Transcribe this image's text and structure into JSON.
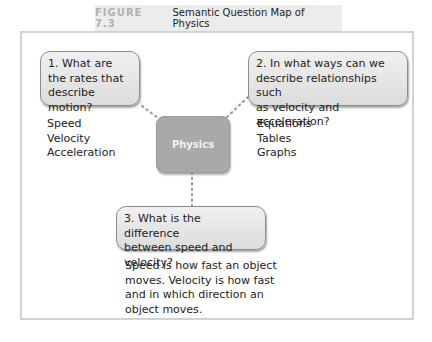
{
  "figure": {
    "label": "FIGURE 7.3",
    "title": "Semantic Question Map of Physics"
  },
  "center": {
    "label": "Physics"
  },
  "questions": [
    {
      "text": "1. What are the rates that describe motion?",
      "lines": [
        "1. What are",
        "the rates that",
        "describe motion?"
      ],
      "answers": [
        "Speed",
        "Velocity",
        "Acceleration"
      ]
    },
    {
      "text": "2. In what ways can we describe relationships such as velocity and acceleration?",
      "lines": [
        "2. In what ways can we",
        "describe relationships such",
        "as velocity and acceleration?"
      ],
      "answers": [
        "Equations",
        "Tables",
        "Graphs"
      ]
    },
    {
      "text": "3. What is the difference between speed and velocity?",
      "lines": [
        "3. What is the difference",
        "between speed and velocity?"
      ],
      "answers": [
        "Speed is how fast an object",
        "moves. Velocity is how fast",
        "and in which direction an",
        "object moves."
      ]
    }
  ],
  "colors": {
    "box_border": "#8c8c8c",
    "center_fill": "#a9a9a9",
    "frame_border": "#d2d2d2",
    "tab_fill": "#ececec",
    "figure_label": "#b0b0b0",
    "connector": "#9a9a9a"
  }
}
